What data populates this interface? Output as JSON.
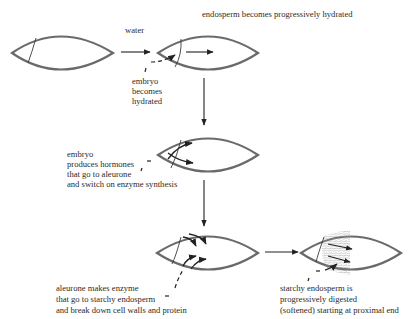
{
  "diagram": {
    "type": "process-flow",
    "steps": [
      {
        "id": "dry-seed",
        "label": ""
      },
      {
        "id": "hydration",
        "arrow_label": "water",
        "caption": "endosperm becomes progressively hydrated",
        "note_lines": [
          "embryo",
          "becomes",
          "hydrated"
        ]
      },
      {
        "id": "hormones",
        "note_lines": [
          "embryo",
          "produces hormones",
          "that go to aleurone",
          "and switch on enzyme synthesis"
        ]
      },
      {
        "id": "enzymes",
        "note_lines": [
          "aleurone makes enzyme",
          "that go to starchy endosperm",
          "and break down cell walls and protein"
        ]
      },
      {
        "id": "digestion",
        "note_lines": [
          "starchy endosperm is",
          "progressively digested",
          "(softened) starting at proximal end"
        ]
      }
    ]
  },
  "colors": {
    "outline": "#6a6a6a",
    "ink": "#222222",
    "hatch": "#9a9a9a"
  }
}
